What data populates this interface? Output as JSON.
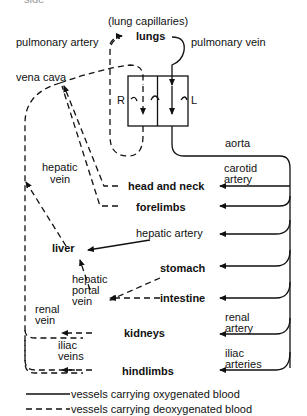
{
  "caption_fragment": "side",
  "labels": {
    "lung_capillaries": "(lung capillaries)",
    "lungs": "lungs",
    "pulmonary_artery": "pulmonary artery",
    "pulmonary_vein": "pulmonary vein",
    "vena_cava": "vena cava",
    "heart_right": "R",
    "heart_left": "L",
    "aorta": "aorta",
    "hepatic_vein_1": "hepatic",
    "hepatic_vein_2": "vein",
    "carotid_artery_1": "carotid",
    "carotid_artery_2": "artery",
    "head_and_neck": "head and neck",
    "forelimbs": "forelimbs",
    "hepatic_artery": "hepatic artery",
    "liver": "liver",
    "stomach": "stomach",
    "hepatic_portal_vein_1": "hepatic",
    "hepatic_portal_vein_2": "portal",
    "hepatic_portal_vein_3": "vein",
    "intestine": "intestine",
    "renal_vein_1": "renal",
    "renal_vein_2": "vein",
    "renal_artery_1": "renal",
    "renal_artery_2": "artery",
    "kidneys": "kidneys",
    "iliac_veins_1": "iliac",
    "iliac_veins_2": "veins",
    "iliac_arteries_1": "iliac",
    "iliac_arteries_2": "arteries",
    "hindlimbs": "hindlimbs"
  },
  "legend": {
    "oxygenated": "vessels carrying oxygenated blood",
    "deoxygenated": "vessels carrying deoxygenated blood"
  },
  "colors": {
    "line": "#111111",
    "background": "#ffffff"
  }
}
